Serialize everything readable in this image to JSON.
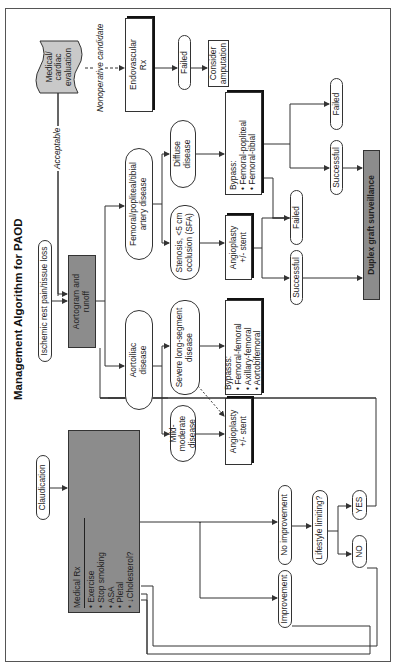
{
  "title": "Management Algorithm for PAOD",
  "nodes": {
    "ischemic": "Ischemic rest pain/tissue loss",
    "aortogram": "Aortogram and runoff",
    "medical_cardiac": "Medical/ cardiac evaluation",
    "endovascular": "Endovascular Rx",
    "failed_endo": "Failed",
    "consider_amputation": "Consider amputation",
    "fem_pop_tib": "Femoral/popliteal/tibial artery disease",
    "diffuse": "Diffuse disease",
    "bypass_fem": {
      "title": "Bypass:",
      "items": [
        "Femoral-popliteal",
        "Femoral-tibial"
      ]
    },
    "failed_bypass": "Failed",
    "successful_bypass": "Successful",
    "duplex": "Duplex graft surveillance",
    "stenosis": "Stenosis, <5 cm occlusion (SFA)",
    "angioplasty_fem": "Angioplasty +/- stent",
    "failed_angio": "Failed",
    "successful_angio": "Successful",
    "aortoiliac": "Aortoiliac disease",
    "severe": "Severe long-segment disease",
    "bypass_aorto": {
      "title": "Bypasss:",
      "items": [
        "Femoral-femoral",
        "Axillary-femoral",
        "Aortobifemoral"
      ]
    },
    "mild": "Mild-moderate disease",
    "angioplasty_aorto": "Angioplasty +/- stent",
    "claudication": "Claudication",
    "medical_rx": {
      "title": "Medical Rx",
      "items": [
        "Exercise",
        "Stop smoking",
        "ASA",
        "Pletal",
        "↓Cholesterol?"
      ]
    },
    "improvement": "Improvement",
    "no_improvement": "No improvement",
    "lifestyle": "Lifestyle limiting?",
    "yes": "YES",
    "no": "NO"
  },
  "edge_labels": {
    "acceptable": "Acceptable",
    "nonoperative": "Nonoperative candidate"
  },
  "colors": {
    "gray_fill": "#8c8c8c",
    "doc_fill": "#c9c9c9",
    "line": "#333333"
  }
}
